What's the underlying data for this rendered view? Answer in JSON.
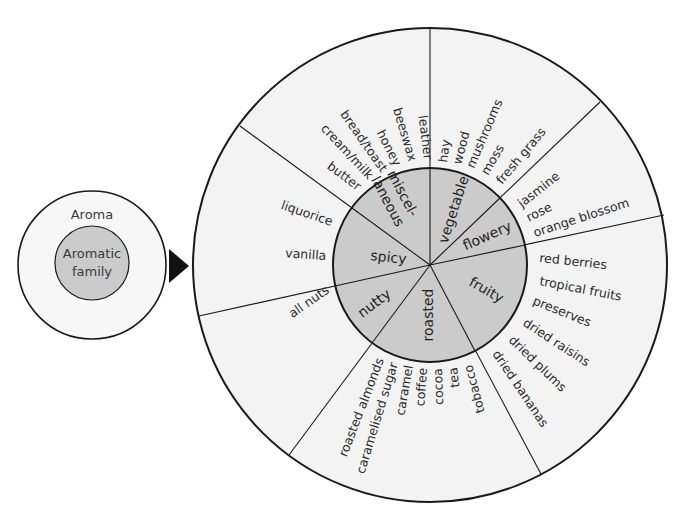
{
  "legend": {
    "outer_label": "Aroma",
    "inner_label_line1": "Aromatic",
    "inner_label_line2": "family"
  },
  "colors": {
    "inner_fill": "#cbcbcb",
    "outer_fill": "#f3f3f3",
    "stroke": "#1a1a1a"
  },
  "families": {
    "miscellaneous_line1": "miscel-",
    "miscellaneous_line2": "laneous",
    "vegetable": "vegetable",
    "flowery": "flowery",
    "fruity": "fruity",
    "roasted": "roasted",
    "nutty": "nutty",
    "spicy": "spicy"
  },
  "aromas": {
    "miscellaneous": [
      "leather",
      "beeswax",
      "honey",
      "bread/toast",
      "cream/milk",
      "butter"
    ],
    "vegetable": [
      "hay",
      "wood",
      "mushrooms",
      "moss",
      "fresh grass"
    ],
    "flowery": [
      "jasmine",
      "rose",
      "orange blossom"
    ],
    "fruity": [
      "red berries",
      "tropical fruits",
      "preserves",
      "dried raisins",
      "dried plums",
      "dried bananas"
    ],
    "roasted": [
      "roasted almonds",
      "caramelised sugar",
      "caramel",
      "coffee",
      "cocoa",
      "tea",
      "tobacco"
    ],
    "nutty": [
      "all nuts"
    ],
    "spicy": [
      "liquorice",
      "vanilla"
    ]
  }
}
